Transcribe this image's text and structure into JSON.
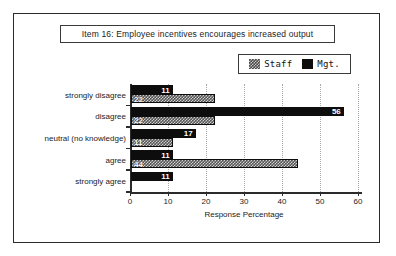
{
  "chart_data": {
    "type": "bar",
    "orientation": "horizontal",
    "title": "Item 16:  Employee incentives encourages increased output",
    "xlabel": "Response Percentage",
    "ylabel": "",
    "categories": [
      "strongly disagree",
      "disagree",
      "neutral (no knowledge)",
      "agree",
      "strongly agree"
    ],
    "series": [
      {
        "name": "Mgt.",
        "color": "#0d0d0d",
        "values": [
          11,
          56,
          17,
          11,
          11
        ]
      },
      {
        "name": "Staff",
        "color": "#555555",
        "values": [
          22,
          22,
          11,
          44,
          0
        ]
      }
    ],
    "xlim": [
      0,
      60
    ],
    "xticks": [
      0,
      10,
      20,
      30,
      40,
      50,
      60
    ],
    "xtick_labels": [
      "0",
      "10",
      "20",
      "30",
      "40",
      "50",
      "60"
    ],
    "grid": true,
    "legend_position": "top-right",
    "value_labels": {
      "mgt": [
        "11",
        "56",
        "17",
        "11",
        "11"
      ],
      "staff": [
        "22",
        "22",
        "11",
        "44",
        ""
      ]
    }
  },
  "legend": {
    "entries": [
      {
        "label": "Staff",
        "swatch": "hatched-gray"
      },
      {
        "label": "Mgt.",
        "swatch": "solid-black"
      }
    ]
  }
}
